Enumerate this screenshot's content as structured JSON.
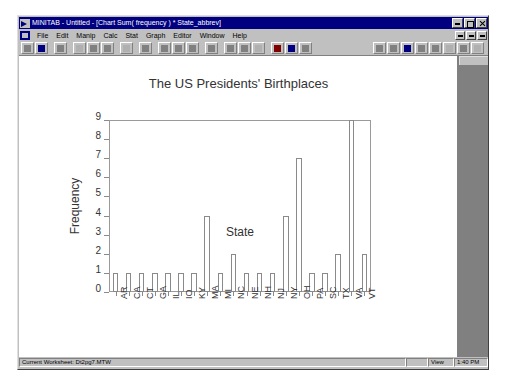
{
  "window": {
    "title": "MINITAB - Untitled - [Chart Sum( frequency ) * State_abbrev]",
    "logo_icon": "minitab-arrow-logo",
    "minimize_label": "_",
    "maximize_label": "□",
    "close_label": "×"
  },
  "menu": {
    "document_icon": "document-icon",
    "items": [
      {
        "label": "File"
      },
      {
        "label": "Edit"
      },
      {
        "label": "Manip"
      },
      {
        "label": "Calc"
      },
      {
        "label": "Stat"
      },
      {
        "label": "Graph"
      },
      {
        "label": "Editor"
      },
      {
        "label": "Window"
      },
      {
        "label": "Help"
      }
    ],
    "mdi_buttons": [
      {
        "name": "mdi-minimize"
      },
      {
        "name": "mdi-restore"
      },
      {
        "name": "mdi-close"
      }
    ]
  },
  "toolbar": {
    "buttons": [
      {
        "name": "open-icon",
        "state": "enabled"
      },
      {
        "name": "save-icon",
        "state": "enabled"
      },
      {
        "name": "print-icon",
        "state": "enabled"
      },
      {
        "name": "cut-icon",
        "state": "disabled"
      },
      {
        "name": "copy-icon",
        "state": "enabled"
      },
      {
        "name": "paste-icon",
        "state": "enabled"
      },
      {
        "name": "undo-icon",
        "state": "disabled"
      },
      {
        "name": "session-window-icon",
        "state": "enabled"
      },
      {
        "name": "worksheet-icon",
        "state": "enabled"
      },
      {
        "name": "history-icon",
        "state": "enabled"
      },
      {
        "name": "project-manager-icon",
        "state": "enabled"
      },
      {
        "name": "graph-window-icon",
        "state": "enabled"
      },
      {
        "name": "cursor-tool-icon",
        "state": "enabled"
      },
      {
        "name": "brush-tool-icon",
        "state": "enabled"
      },
      {
        "name": "edit-tool-icon",
        "state": "disabled"
      },
      {
        "name": "cancel-icon",
        "state": "enabled"
      },
      {
        "name": "help-icon",
        "state": "enabled"
      },
      {
        "name": "info-icon",
        "state": "enabled"
      }
    ],
    "right_buttons": [
      {
        "name": "layout-icon"
      },
      {
        "name": "zoom-icon"
      },
      {
        "name": "palette-icon"
      },
      {
        "name": "annotate-icon"
      },
      {
        "name": "region-icon"
      },
      {
        "name": "grid-icon"
      },
      {
        "name": "marker-icon"
      },
      {
        "name": "options-icon"
      }
    ]
  },
  "status_bar": {
    "worksheet": "Current Worksheet: Dt2pg7.MTW",
    "blank": "",
    "mode": "View",
    "time": "1:40 PM"
  },
  "chart_data": {
    "type": "bar",
    "title": "The US Presidents' Birthplaces",
    "xlabel": "State",
    "ylabel": "Frequency",
    "ylim": [
      0,
      9
    ],
    "yticks": [
      0,
      1,
      2,
      3,
      4,
      5,
      6,
      7,
      8,
      9
    ],
    "grid": false,
    "legend": "none",
    "categories": [
      "AR",
      "CA",
      "CT",
      "GA",
      "IL",
      "IO",
      "KY",
      "MA",
      "MI",
      "NC",
      "NE",
      "NH",
      "NJ",
      "NY",
      "OH",
      "PA",
      "SC",
      "TX",
      "VA",
      "VT"
    ],
    "values": [
      1,
      1,
      1,
      1,
      1,
      1,
      1,
      4,
      1,
      2,
      1,
      1,
      1,
      4,
      7,
      1,
      1,
      2,
      9,
      2
    ],
    "bar_fill": "#ffffff",
    "bar_edge": "#8a8a8a"
  }
}
